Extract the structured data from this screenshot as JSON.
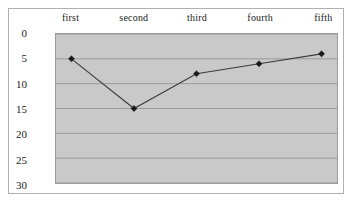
{
  "chart_data": {
    "type": "line",
    "title": "",
    "subtitle": "",
    "xlabel": "",
    "ylabel": "",
    "categories": [
      "first",
      "second",
      "third",
      "fourth",
      "fifth"
    ],
    "series": [
      {
        "name": "Series 1",
        "values": [
          5,
          15,
          8,
          6,
          4
        ],
        "line_color": "#3b3b3b",
        "marker": "diamond",
        "marker_color": "#1a1a1a"
      }
    ],
    "ylim": [
      0,
      30
    ],
    "y_ticks": [
      0,
      5,
      10,
      15,
      20,
      25,
      30
    ],
    "y_axis_inverted": true,
    "x_axis_position": "top",
    "grid": {
      "horizontal": true,
      "vertical": false,
      "color": "#8f8f8f"
    },
    "legend": {
      "visible": false,
      "position": "none"
    },
    "plot_background_color": "#c9c9c9",
    "figure_background_color": "#ffffff",
    "figure_border_color": "#b0b0b0",
    "plot_border_color": "#9a9a9a"
  }
}
